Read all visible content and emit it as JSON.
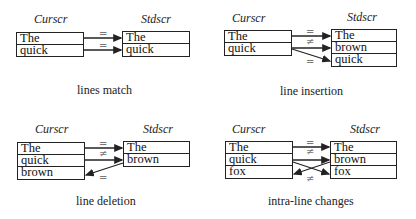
{
  "panels": [
    {
      "id": "lines-match",
      "curscr_label": "Curscr",
      "stdscr_label": "Stdscr",
      "curscr_lines": [
        "The",
        "quick"
      ],
      "stdscr_lines": [
        "The",
        "quick"
      ],
      "relations": [
        "=",
        "="
      ],
      "caption": "lines match"
    },
    {
      "id": "line-insertion",
      "curscr_label": "Curscr",
      "stdscr_label": "Stdscr",
      "curscr_lines": [
        "The",
        "quick"
      ],
      "stdscr_lines": [
        "The",
        "brown",
        "quick"
      ],
      "relations": [
        "=",
        "≠",
        "="
      ],
      "caption": "line insertion"
    },
    {
      "id": "line-deletion",
      "curscr_label": "Curscr",
      "stdscr_label": "Stdscr",
      "curscr_lines": [
        "The",
        "quick",
        "brown"
      ],
      "stdscr_lines": [
        "The",
        "brown"
      ],
      "relations": [
        "=",
        "≠",
        "="
      ],
      "caption": "line deletion"
    },
    {
      "id": "intra-line-changes",
      "curscr_label": "Curscr",
      "stdscr_label": "Stdscr",
      "curscr_lines": [
        "The",
        "quick",
        "fox"
      ],
      "stdscr_lines": [
        "The",
        "brown",
        "fox"
      ],
      "relations": [
        "=",
        "≠",
        "≠"
      ],
      "caption": "intra-line changes"
    }
  ]
}
